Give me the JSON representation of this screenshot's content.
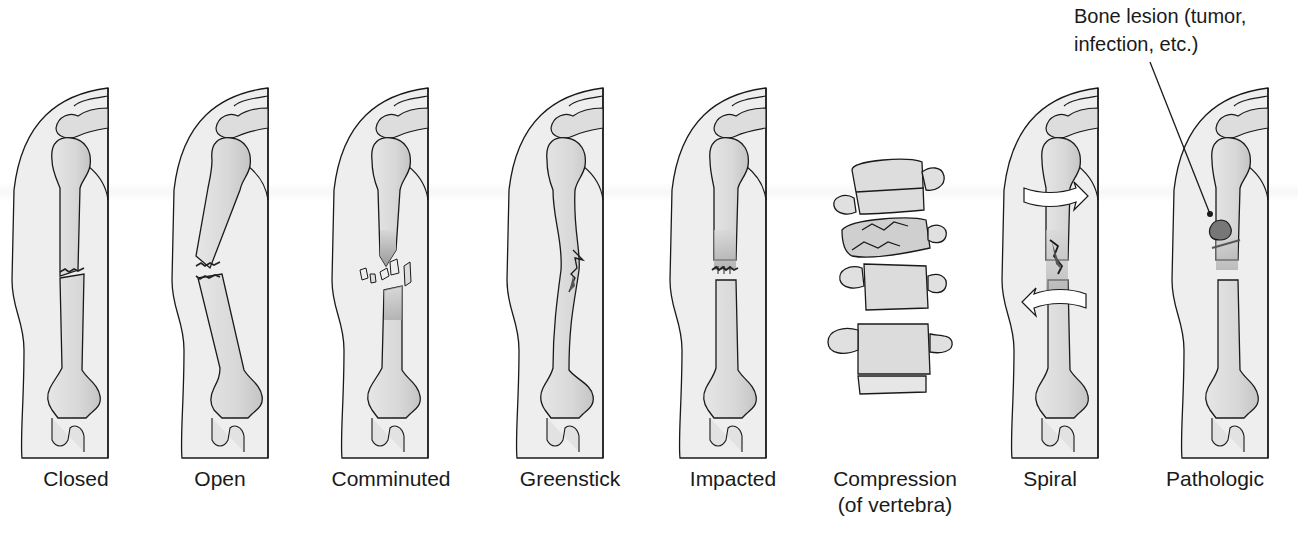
{
  "figure": {
    "colors": {
      "outline": "#1a1a1a",
      "skin": "#eeeeee",
      "bone": "#dcdcdc",
      "bone_shadow": "#b0b0b0",
      "fracture_dark": "#555555",
      "background": "#ffffff"
    }
  },
  "panels": [
    {
      "id": "closed",
      "label": "Closed"
    },
    {
      "id": "open",
      "label": "Open"
    },
    {
      "id": "comminuted",
      "label": "Comminuted"
    },
    {
      "id": "greenstick",
      "label": "Greenstick"
    },
    {
      "id": "impacted",
      "label": "Impacted"
    },
    {
      "id": "compression",
      "label": "Compression",
      "label_line2": "(of vertebra)"
    },
    {
      "id": "spiral",
      "label": "Spiral"
    },
    {
      "id": "pathologic",
      "label": "Pathologic"
    }
  ],
  "annotation": {
    "line1": "Bone lesion (tumor,",
    "line2": "infection, etc.)",
    "points_to": "pathologic"
  }
}
